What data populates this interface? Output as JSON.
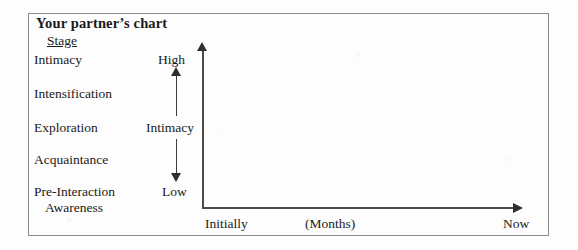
{
  "chart_card": {
    "title": "Your partner’s chart",
    "stage_column_header": "Stage",
    "stages": [
      {
        "label": "Intimacy"
      },
      {
        "label": "Intensification"
      },
      {
        "label": "Exploration"
      },
      {
        "label": "Acquaintance"
      },
      {
        "label": "Pre-Interaction",
        "label_line2": "Awareness"
      }
    ],
    "y_axis": {
      "high_label": "High",
      "name_label": "Intimacy",
      "low_label": "Low"
    },
    "x_axis": {
      "start_label": "Initially",
      "middle_label": "(Months)",
      "end_label": "Now"
    }
  }
}
